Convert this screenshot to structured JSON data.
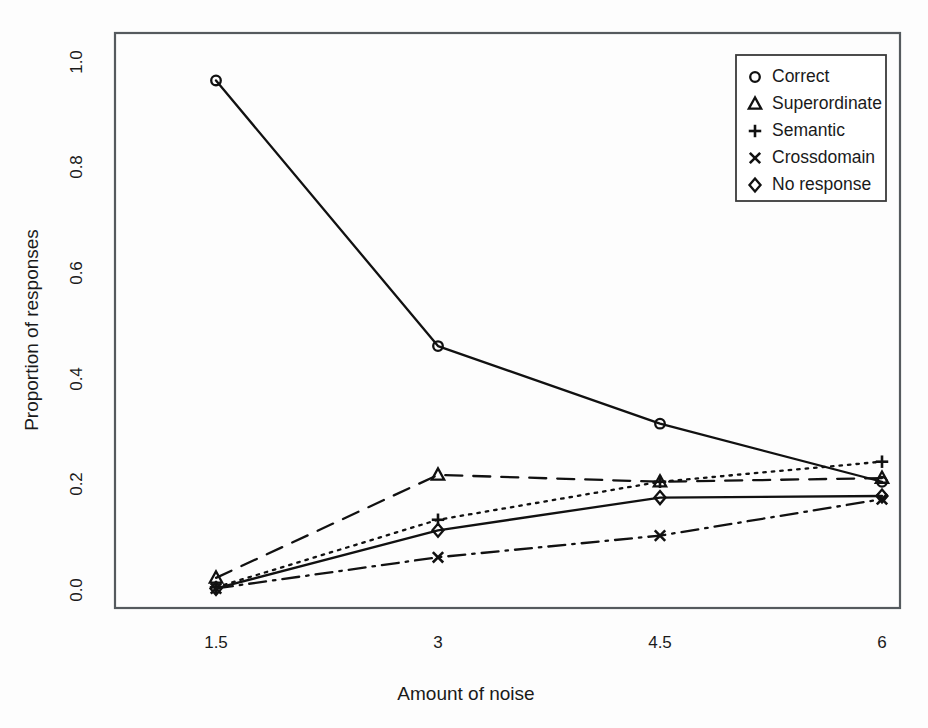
{
  "chart_data": {
    "type": "line",
    "title": "",
    "xlabel": "Amount of noise",
    "ylabel": "Proportion of responses",
    "x": [
      1.5,
      3,
      4.5,
      6
    ],
    "categories": [
      "1.5",
      "3",
      "4.5",
      "6"
    ],
    "xtick_labels": [
      "1.5",
      "3",
      "4.5",
      "6"
    ],
    "ytick_labels": [
      "0.0",
      "0.2",
      "0.4",
      "0.6",
      "0.8",
      "1.0"
    ],
    "ytick_values": [
      0.0,
      0.2,
      0.4,
      0.6,
      0.8,
      1.0
    ],
    "ylim": [
      -0.02,
      1.0
    ],
    "xlim": [
      1.0,
      6.35
    ],
    "grid": false,
    "legend_position": "top-right",
    "series": [
      {
        "name": "Correct",
        "marker": "circle",
        "linestyle": "solid",
        "values": [
          0.965,
          0.462,
          0.315,
          0.205
        ]
      },
      {
        "name": "Superordinate",
        "marker": "triangle",
        "linestyle": "dashed",
        "values": [
          0.023,
          0.218,
          0.205,
          0.212
        ]
      },
      {
        "name": "Semantic",
        "marker": "plus",
        "linestyle": "dotted",
        "values": [
          0.005,
          0.133,
          0.205,
          0.243
        ]
      },
      {
        "name": "Crossdomain",
        "marker": "cross",
        "linestyle": "dashdot",
        "values": [
          0.003,
          0.062,
          0.103,
          0.172
        ]
      },
      {
        "name": "No response",
        "marker": "diamond",
        "linestyle": "solid",
        "values": [
          0.003,
          0.113,
          0.175,
          0.178
        ]
      }
    ]
  },
  "axes": {
    "x_title": "Amount of noise",
    "y_title": "Proportion of responses",
    "x_ticks": [
      "1.5",
      "3",
      "4.5",
      "6"
    ],
    "y_ticks": [
      "0.0",
      "0.2",
      "0.4",
      "0.6",
      "0.8",
      "1.0"
    ]
  },
  "legend": {
    "entries": [
      {
        "label": "Correct",
        "marker": "circle-marker"
      },
      {
        "label": "Superordinate",
        "marker": "triangle-marker"
      },
      {
        "label": "Semantic",
        "marker": "plus-marker"
      },
      {
        "label": "Crossdomain",
        "marker": "cross-marker"
      },
      {
        "label": "No response",
        "marker": "diamond-marker"
      }
    ]
  },
  "colors": {
    "ink": "#111111",
    "frame": "#555a5e",
    "background": "#fdfdfd"
  }
}
